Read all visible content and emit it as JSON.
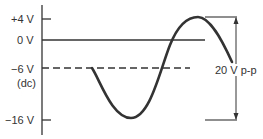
{
  "diagram": {
    "labels": {
      "plus4": "+4 V",
      "zero": "0 V",
      "minus6": "−6 V",
      "dc": "(dc)",
      "minus16": "−16 V",
      "pp": "20 V p-p"
    },
    "levels_volts": [
      4,
      0,
      -6,
      -16
    ],
    "dc_level_volts": -6,
    "peak_to_peak_volts": 20,
    "colors": {
      "stroke": "#333333",
      "background": "#ffffff"
    }
  }
}
